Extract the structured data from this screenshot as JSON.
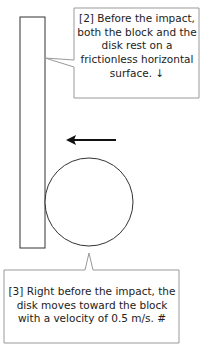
{
  "diagram": {
    "block": {
      "label": "block"
    },
    "disk": {
      "label": "disk"
    },
    "arrow": {
      "direction": "left",
      "meaning": "disk velocity direction"
    },
    "callouts": [
      {
        "id": "2",
        "text": "[2] Before the impact, both the block and the disk rest on a frictionless horizontal surface. ↓"
      },
      {
        "id": "3",
        "text": "[3] Right before the impact, the disk moves toward the block with a velocity of 0.5 m/s. #"
      }
    ]
  },
  "colors": {
    "stroke": "#333333",
    "callout_border": "#888888",
    "background": "#ffffff"
  }
}
